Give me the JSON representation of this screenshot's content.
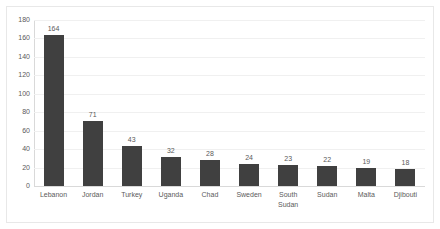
{
  "chart_data": {
    "type": "bar",
    "title": "",
    "subtitle": "",
    "xlabel": "",
    "ylabel": "",
    "categories": [
      "Lebanon",
      "Jordan",
      "Turkey",
      "Uganda",
      "Chad",
      "Sweden",
      "South Sudan",
      "Sudan",
      "Malta",
      "Djibouti"
    ],
    "values": [
      164,
      71,
      43,
      32,
      28,
      24,
      23,
      22,
      19,
      18
    ],
    "data_labels": [
      "164",
      "71",
      "43",
      "32",
      "28",
      "24",
      "23",
      "22",
      "19",
      "18"
    ],
    "ylim": [
      0,
      180
    ],
    "ytick_values": [
      0,
      20,
      40,
      60,
      80,
      100,
      120,
      140,
      160,
      180
    ],
    "ytick_labels": [
      "0",
      "20",
      "40",
      "60",
      "80",
      "100",
      "120",
      "140",
      "160",
      "180"
    ],
    "ytick_step": 20,
    "grid": true,
    "grid_axis": "y",
    "legend": false,
    "legend_position": "none",
    "series": [
      {
        "name": "",
        "values": [
          164,
          71,
          43,
          32,
          28,
          24,
          23,
          22,
          19,
          18
        ]
      }
    ],
    "annotations": []
  },
  "style": {
    "bar_color": "#404040",
    "grid_color": "#f0f0f0",
    "axis_color": "#d9d9d9",
    "text_color": "#5a5a5a",
    "frame_color": "#e8e8e8",
    "background": "#ffffff"
  }
}
